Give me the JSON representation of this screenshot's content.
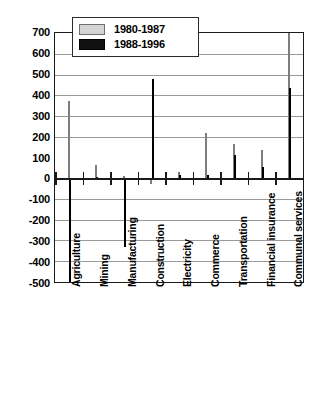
{
  "chart_data": {
    "type": "bar",
    "title": "",
    "subtitle": "",
    "xlabel": "",
    "ylabel": "",
    "ylim": [
      -500,
      700
    ],
    "ytick_step": 100,
    "yticks": [
      700,
      600,
      500,
      400,
      300,
      200,
      100,
      0,
      -100,
      -200,
      -300,
      -400,
      -500
    ],
    "ytick_labels": [
      "700",
      "600",
      "500",
      "400",
      "300",
      "200",
      "100",
      "0",
      "-100",
      "-200",
      "-300",
      "-400",
      "-500"
    ],
    "grid": true,
    "grid_axis": "y",
    "legend_position": "top-left-inside",
    "categories": [
      "Agriculture",
      "Mining",
      "Manufacturing",
      "Construction",
      "Electricity",
      "Commerce",
      "Transportation",
      "Financial insurance",
      "Communal services"
    ],
    "series": [
      {
        "name": "1980-1987",
        "color": "#d4d4d4",
        "values": [
          370,
          65,
          10,
          -30,
          30,
          220,
          165,
          135,
          700
        ]
      },
      {
        "name": "1988-1996",
        "color": "#111111",
        "values": [
          -500,
          8,
          -330,
          480,
          15,
          15,
          110,
          55,
          435
        ]
      }
    ]
  },
  "legend": {
    "entries": [
      {
        "label": "1980-1987",
        "swatch": "gray-swatch"
      },
      {
        "label": "1988-1996",
        "swatch": "black-swatch"
      }
    ]
  }
}
